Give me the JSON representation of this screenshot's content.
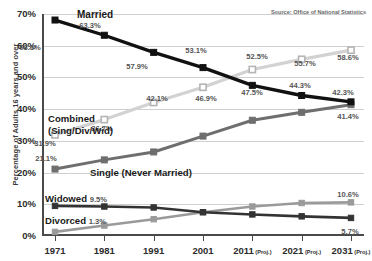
{
  "source_note": "Source: Office of National Statistics",
  "axis": {
    "ylabel": "Percentage of Adults 16 years and over",
    "yticks": [
      "0%",
      "10%",
      "20%",
      "30%",
      "40%",
      "50%",
      "60%",
      "70%"
    ],
    "xticks": [
      "1971",
      "1981",
      "1991",
      "2001",
      "2011",
      "2021",
      "2031"
    ],
    "proj_suffix": "(Proj.)",
    "proj_flags": [
      false,
      false,
      false,
      false,
      true,
      true,
      true
    ]
  },
  "series_labels": {
    "married": "Married",
    "combined_line1": "Combined",
    "combined_line2": "(Sing/Div/Wid)",
    "single": "Single (Never Married)",
    "widowed": "Widowed",
    "widowed_value": "9.5%",
    "divorced": "Divorced",
    "divorced_value": "1.3%"
  },
  "colors": {
    "married": "#111111",
    "combined": "#d2d2d2",
    "single": "#6e6e6e",
    "widowed": "#333333",
    "divorced": "#9a9a9a",
    "grid": "#cfcfcf",
    "axis": "#4a4a4a",
    "text": "#2c2c2c"
  },
  "chart_data": {
    "type": "line",
    "title": "",
    "xlabel": "",
    "ylabel": "Percentage of Adults 16 years and over",
    "x": [
      "1971",
      "1981",
      "1991",
      "2001",
      "2011 (Proj.)",
      "2021 (Proj.)",
      "2031 (Proj.)"
    ],
    "ylim": [
      0,
      70
    ],
    "ytick_values": [
      0,
      10,
      20,
      30,
      40,
      50,
      60,
      70
    ],
    "grid": "horizontal",
    "legend": "inline-annotations",
    "series": [
      {
        "name": "Married",
        "color": "#111111",
        "marker": "filled-square",
        "values": [
          68.1,
          63.3,
          57.9,
          53.1,
          47.5,
          44.3,
          42.3
        ],
        "labels": [
          "68.1%",
          "63.3%",
          "57.9%",
          "53.1%",
          "47.5%",
          "44.3%",
          "42.3%"
        ]
      },
      {
        "name": "Combined (Sing/Div/Wid)",
        "color": "#d2d2d2",
        "marker": "open-square",
        "values": [
          31.9,
          36.7,
          42.1,
          46.9,
          52.5,
          55.7,
          58.6
        ],
        "labels": [
          "31.9%",
          "36.7%",
          "42.1%",
          "46.9%",
          "52.5%",
          "55.7%",
          "58.6%"
        ]
      },
      {
        "name": "Single (Never Married)",
        "color": "#6e6e6e",
        "marker": "filled-square",
        "values": [
          21.1,
          24.0,
          26.5,
          31.5,
          36.5,
          39.0,
          41.4
        ],
        "labels": [
          "21.1%",
          "",
          "",
          "",
          "",
          "",
          "41.4%"
        ]
      },
      {
        "name": "Widowed",
        "color": "#333333",
        "marker": "filled-square",
        "values": [
          9.5,
          9.3,
          9.0,
          7.5,
          6.8,
          6.2,
          5.7
        ],
        "labels": [
          "9.5%",
          "",
          "",
          "",
          "",
          "",
          "5.7%"
        ]
      },
      {
        "name": "Divorced",
        "color": "#9a9a9a",
        "marker": "filled-square",
        "values": [
          1.3,
          3.3,
          5.3,
          7.5,
          9.3,
          10.4,
          10.6
        ],
        "labels": [
          "1.3%",
          "",
          "",
          "",
          "",
          "",
          "10.6%"
        ]
      }
    ]
  },
  "value_label_positions": [
    {
      "key": "m0",
      "text": "68.1%",
      "x": 30,
      "y": 47,
      "dark": false
    },
    {
      "key": "m1",
      "text": "63.3%",
      "x": 90,
      "y": 25,
      "dark": false
    },
    {
      "key": "m2",
      "text": "57.9%",
      "x": 137,
      "y": 66,
      "dark": false
    },
    {
      "key": "m3",
      "text": "53.1%",
      "x": 196,
      "y": 50,
      "dark": false
    },
    {
      "key": "m4",
      "text": "47.5%",
      "x": 252,
      "y": 92,
      "dark": false
    },
    {
      "key": "m5",
      "text": "44.3%",
      "x": 300,
      "y": 85,
      "dark": false
    },
    {
      "key": "m6",
      "text": "42.3%",
      "x": 343,
      "y": 92,
      "dark": false
    },
    {
      "key": "c0",
      "text": "31.9%",
      "x": 45,
      "y": 143,
      "dark": false
    },
    {
      "key": "c1",
      "text": "36.7%",
      "x": 102,
      "y": 128,
      "dark": false
    },
    {
      "key": "c2",
      "text": "42.1%",
      "x": 157,
      "y": 98,
      "dark": false
    },
    {
      "key": "c3",
      "text": "46.9%",
      "x": 206,
      "y": 98,
      "dark": false
    },
    {
      "key": "c4",
      "text": "52.5%",
      "x": 257,
      "y": 56,
      "dark": false
    },
    {
      "key": "c5",
      "text": "55.7%",
      "x": 305,
      "y": 63,
      "dark": false
    },
    {
      "key": "c6",
      "text": "58.6%",
      "x": 348,
      "y": 57,
      "dark": false
    },
    {
      "key": "s0",
      "text": "21.1%",
      "x": 46,
      "y": 158,
      "dark": false
    },
    {
      "key": "s6",
      "text": "41.4%",
      "x": 348,
      "y": 116,
      "dark": false
    },
    {
      "key": "w6",
      "text": "5.7%",
      "x": 350,
      "y": 231,
      "dark": false
    },
    {
      "key": "d6",
      "text": "10.6%",
      "x": 348,
      "y": 194,
      "dark": false
    }
  ]
}
